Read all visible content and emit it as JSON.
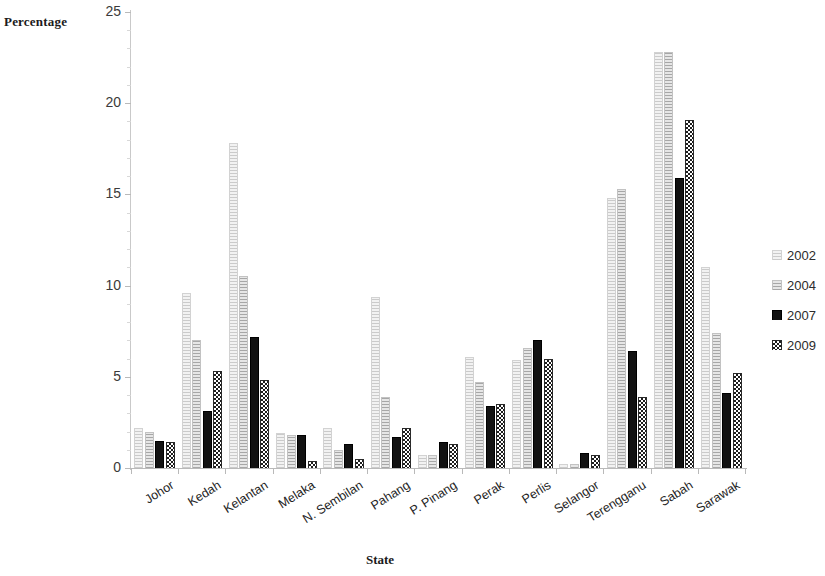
{
  "chart_data": {
    "type": "bar",
    "title": "",
    "xlabel": "State",
    "ylabel": "Percentage",
    "ylim": [
      0,
      25
    ],
    "ytick_values": [
      0,
      5,
      10,
      15,
      20,
      25
    ],
    "ytick_labels": [
      "0",
      "5",
      "10",
      "15",
      "20",
      "25"
    ],
    "grid": false,
    "legend_position": "right",
    "categories": [
      "Johor",
      "Kedah",
      "Kelantan",
      "Melaka",
      "N. Sembilan",
      "Pahang",
      "P. Pinang",
      "Perak",
      "Perlis",
      "Selangor",
      "Terengganu",
      "Sabah",
      "Sarawak"
    ],
    "series": [
      {
        "name": "2002",
        "color": "#f2f2f2",
        "values": [
          2.2,
          9.6,
          17.8,
          1.9,
          2.2,
          9.4,
          0.7,
          6.1,
          5.9,
          0.2,
          14.8,
          22.8,
          11.0
        ]
      },
      {
        "name": "2004",
        "color": "#e6e6e6",
        "values": [
          2.0,
          7.0,
          10.5,
          1.8,
          1.0,
          3.9,
          0.7,
          4.7,
          6.6,
          0.2,
          15.3,
          22.8,
          7.4
        ]
      },
      {
        "name": "2007",
        "color": "#121212",
        "values": [
          1.5,
          3.1,
          7.2,
          1.8,
          1.3,
          1.7,
          1.4,
          3.4,
          7.0,
          0.8,
          6.4,
          15.9,
          4.1
        ]
      },
      {
        "name": "2009",
        "color": "#2a2a2a",
        "values": [
          1.4,
          5.3,
          4.8,
          0.4,
          0.5,
          2.2,
          1.3,
          3.5,
          6.0,
          0.7,
          3.9,
          19.1,
          5.2
        ]
      }
    ]
  },
  "legend": {
    "entries": [
      {
        "label": "2002"
      },
      {
        "label": "2004"
      },
      {
        "label": "2007"
      },
      {
        "label": "2009"
      }
    ]
  }
}
